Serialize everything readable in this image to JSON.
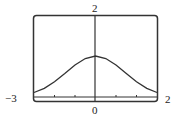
{
  "chart_data": {
    "type": "line",
    "title": "",
    "xlabel": "",
    "ylabel": "",
    "xlim": [
      -3,
      3
    ],
    "ylim": [
      0,
      2
    ],
    "grid": false,
    "legend": null,
    "x_ticks": [
      -2,
      -1,
      0,
      1,
      2
    ],
    "labels": {
      "top": "2",
      "bottom": "0",
      "left": "−3",
      "right": "2"
    },
    "series": [
      {
        "name": "curve",
        "x": [
          -3,
          -2.5,
          -2,
          -1.5,
          -1,
          -0.5,
          0,
          0.5,
          1,
          1.5,
          2,
          2.5,
          3
        ],
        "y": [
          0.11,
          0.21,
          0.37,
          0.57,
          0.78,
          0.94,
          1.0,
          0.94,
          0.78,
          0.57,
          0.37,
          0.21,
          0.11
        ]
      }
    ],
    "colors": {
      "frame": "#333333",
      "curve": "#333333",
      "axis": "#333333"
    }
  }
}
